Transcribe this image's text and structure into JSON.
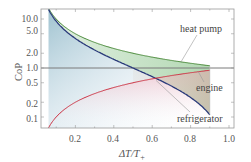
{
  "chart_data": {
    "type": "line",
    "title": "",
    "xlabel": "ΔT/T₊",
    "ylabel": "CoP",
    "xlim": [
      0.02,
      1.02
    ],
    "ylim": [
      0.06,
      15
    ],
    "yscale": "log",
    "grid": false,
    "legend": "inline annotations",
    "x_ticks": [
      "0.2",
      "0.4",
      "0.6",
      "0.8",
      "1.0"
    ],
    "y_ticks": [
      "10.0",
      "5.0",
      "2.0",
      "1.0",
      "0.5",
      "0.2",
      "0.1"
    ],
    "x": [
      0.07,
      0.1,
      0.15,
      0.2,
      0.3,
      0.4,
      0.5,
      0.6,
      0.7,
      0.8,
      0.9
    ],
    "series": [
      {
        "name": "heat pump",
        "formula": "1/x",
        "color": "#4a8a3a",
        "values": [
          14.3,
          10.0,
          6.67,
          5.0,
          3.33,
          2.5,
          2.0,
          1.67,
          1.43,
          1.25,
          1.11
        ]
      },
      {
        "name": "refrigerator",
        "formula": "(1-x)/x",
        "color": "#2a3a7a",
        "values": [
          13.3,
          9.0,
          5.67,
          4.0,
          2.33,
          1.5,
          1.0,
          0.667,
          0.429,
          0.25,
          0.111
        ]
      },
      {
        "name": "engine",
        "formula": "x",
        "color": "#cc3344",
        "values": [
          0.07,
          0.1,
          0.15,
          0.2,
          0.3,
          0.4,
          0.5,
          0.6,
          0.7,
          0.8,
          0.9
        ]
      }
    ],
    "reference_line": {
      "y": 1.0,
      "color": "#777777"
    },
    "annotations": [
      {
        "text": "heat pump",
        "points_to": "heat pump curve near x≈0.75"
      },
      {
        "text": "engine",
        "points_to": "engine curve near x≈0.85"
      },
      {
        "text": "refrigerator",
        "points_to": "refrigerator curve near x≈0.62"
      }
    ]
  },
  "labels": {
    "ylabel": "CoP",
    "xlabel_main": "ΔT/T",
    "xlabel_sub": "+",
    "heat_pump": "heat pump",
    "engine": "engine",
    "refrigerator": "refrigerator",
    "xt0": "0.2",
    "xt1": "0.4",
    "xt2": "0.6",
    "xt3": "0.8",
    "xt4": "1.0",
    "yt0": "10.0",
    "yt1": "5.0",
    "yt2": "2.0",
    "yt3": "1.0",
    "yt4": "0.5",
    "yt5": "0.2",
    "yt6": "0.1"
  }
}
